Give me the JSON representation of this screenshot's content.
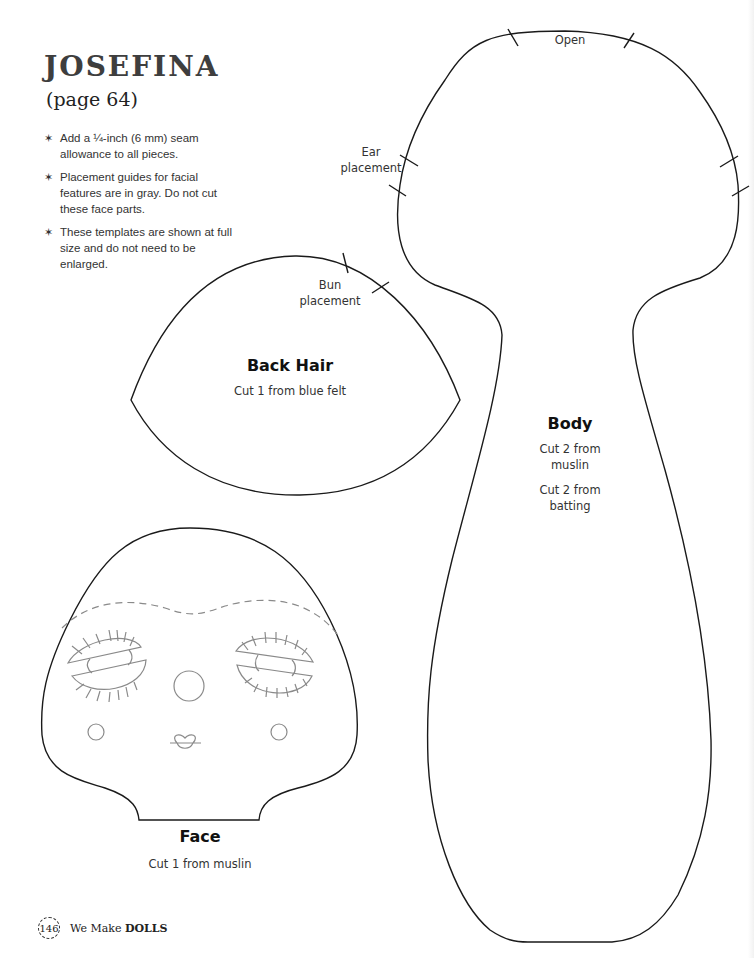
{
  "header": {
    "title": "JOSEFINA",
    "subtitle": "(page 64)"
  },
  "notes": [
    {
      "icon": "asterisk-bullet",
      "text": "Add a ¼-inch (6 mm) seam allowance to all pieces."
    },
    {
      "icon": "asterisk-bullet",
      "text": "Placement guides for facial features are in gray. Do not cut these face parts."
    },
    {
      "icon": "asterisk-bullet",
      "text": "These templates are shown at full size and do not need to be enlarged."
    }
  ],
  "pieces": {
    "back_hair": {
      "name": "Back Hair",
      "instructions": [
        "Cut 1 from blue felt"
      ],
      "markers": {
        "bun_line1": "Bun",
        "bun_line2": "placement"
      }
    },
    "body": {
      "name": "Body",
      "instructions": [
        "Cut 2 from",
        "muslin",
        "Cut 2 from",
        "batting"
      ],
      "markers": {
        "open": "Open",
        "ear_line1": "Ear",
        "ear_line2": "placement"
      }
    },
    "face": {
      "name": "Face",
      "instructions": [
        "Cut 1 from muslin"
      ]
    }
  },
  "colors": {
    "outline": "#1a1a1a",
    "guide_gray": "#8a8a8a"
  },
  "footer": {
    "page_number": "146",
    "book_prefix": "We Make",
    "book_title": "DOLLS"
  }
}
